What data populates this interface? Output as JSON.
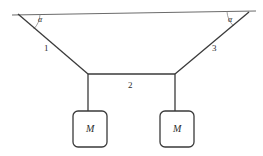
{
  "figure": {
    "background_color": "#ffffff",
    "line_color": "#3a3a3a"
  },
  "ceiling": {
    "name": "ceiling-line",
    "x1": 12,
    "y1": 15,
    "x2": 256,
    "y2": 11
  },
  "ropes": [
    {
      "id": "rope-1",
      "label": "1",
      "x1": 18,
      "y1": 14,
      "x2": 88,
      "y2": 74,
      "label_x": 44,
      "label_y": 44
    },
    {
      "id": "rope-2",
      "label": "2",
      "x1": 88,
      "y1": 74,
      "x2": 175,
      "y2": 74,
      "label_x": 128,
      "label_y": 81
    },
    {
      "id": "rope-3",
      "label": "3",
      "x1": 175,
      "y1": 74,
      "x2": 249,
      "y2": 12,
      "label_x": 212,
      "label_y": 44
    }
  ],
  "hangers": [
    {
      "id": "hanger-left",
      "x": 88,
      "y1": 74,
      "y2": 111
    },
    {
      "id": "hanger-right",
      "x": 175,
      "y1": 74,
      "y2": 111
    }
  ],
  "angles": [
    {
      "id": "angle-left",
      "label": "α",
      "label_x": 38,
      "label_y": 16
    },
    {
      "id": "angle-right",
      "label": "α",
      "label_x": 228,
      "label_y": 16
    }
  ],
  "masses": [
    {
      "id": "mass-left",
      "label": "M",
      "x": 73,
      "y": 111,
      "width": 34,
      "height": 36,
      "corner_radius": 5,
      "label_x": 86,
      "label_y": 124
    },
    {
      "id": "mass-right",
      "label": "M",
      "x": 160,
      "y": 111,
      "width": 34,
      "height": 36,
      "corner_radius": 5,
      "label_x": 173,
      "label_y": 124
    }
  ]
}
